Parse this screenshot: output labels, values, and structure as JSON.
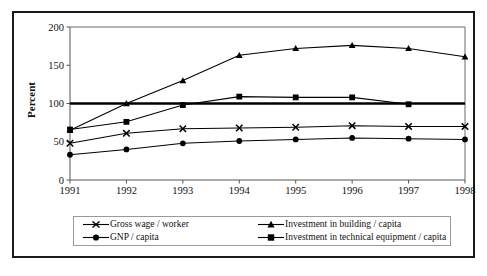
{
  "chart_data": {
    "type": "line",
    "title": "",
    "subtitle": "",
    "xlabel": "",
    "ylabel": "Percent",
    "x": [
      "1991",
      "1992",
      "1993",
      "1994",
      "1995",
      "1996",
      "1997",
      "1998"
    ],
    "categories": [
      "1991",
      "1992",
      "1993",
      "1994",
      "1995",
      "1996",
      "1997",
      "1998"
    ],
    "xlim": [
      1991,
      1998
    ],
    "ylim": [
      0,
      200
    ],
    "yticks": [
      0,
      50,
      100,
      150,
      200
    ],
    "ytick_labels": [
      "0",
      "50",
      "100",
      "150",
      "200"
    ],
    "xticks": [
      "1991",
      "1992",
      "1993",
      "1994",
      "1995",
      "1996",
      "1997",
      "1998"
    ],
    "grid": false,
    "legend_position": "bottom",
    "reference_line": {
      "value": 100,
      "label": "",
      "style": "bold-solid"
    },
    "series": [
      {
        "name": "Gross wage / worker",
        "marker": "x",
        "values": [
          48,
          61,
          67,
          68,
          69,
          71,
          70,
          70
        ]
      },
      {
        "name": "GNP / capita",
        "marker": "circle",
        "values": [
          33,
          40,
          48,
          51,
          53,
          55,
          54,
          53
        ]
      },
      {
        "name": "Investment in building / capita",
        "marker": "triangle",
        "values": [
          65,
          100,
          130,
          163,
          172,
          176,
          172,
          161
        ]
      },
      {
        "name": "Investment in technical equipment / capita",
        "marker": "square",
        "values": [
          66,
          76,
          98,
          109,
          108,
          108,
          99,
          null
        ]
      }
    ]
  },
  "legend": {
    "entries": [
      {
        "label": "Gross wage / worker",
        "marker": "x-marker"
      },
      {
        "label": "GNP / capita",
        "marker": "circle-marker"
      },
      {
        "label": "Investment in building / capita",
        "marker": "triangle-marker"
      },
      {
        "label": "Investment in technical equipment / capita",
        "marker": "square-marker"
      }
    ]
  },
  "colors": {
    "series_stroke": "#000000",
    "axis": "#555555",
    "frame": "#6b6b6b",
    "reference_line": "#000000",
    "background": "#ffffff"
  }
}
